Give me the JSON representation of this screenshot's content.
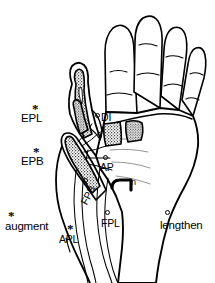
{
  "figure": {
    "ink_color": "#000000",
    "background_color": "#ffffff",
    "stipple_color": "#1a1a1a"
  },
  "legend": {
    "items": [
      {
        "marker": "asterisk-marker",
        "label": "augment"
      },
      {
        "marker": "circle-marker",
        "label": "lengthen"
      }
    ]
  },
  "annotations": [
    {
      "id": "epl",
      "label": "EPL",
      "marker": "asterisk-marker",
      "meaning": "extensor pollicis longus"
    },
    {
      "id": "epb",
      "label": "EPB",
      "marker": "asterisk-marker",
      "meaning": "extensor pollicis brevis"
    },
    {
      "id": "apl",
      "label": "APL",
      "marker": "asterisk-marker",
      "meaning": "abductor pollicis longus"
    },
    {
      "id": "di",
      "label": "DI",
      "marker": "circle-marker",
      "meaning": "dorsal interosseous"
    },
    {
      "id": "ap",
      "label": "AP",
      "marker": "circle-marker",
      "meaning": "adductor pollicis"
    },
    {
      "id": "fpb",
      "label": "FPB",
      "marker": "circle-marker",
      "meaning": "flexor pollicis brevis"
    },
    {
      "id": "fpl",
      "label": "FPL",
      "marker": "circle-marker",
      "meaning": "flexor pollicis longus"
    },
    {
      "id": "n",
      "label": "n",
      "marker": "none",
      "meaning": "nerve"
    }
  ],
  "markers": {
    "asterisk_glyph": "*",
    "circle_glyph": "o"
  }
}
